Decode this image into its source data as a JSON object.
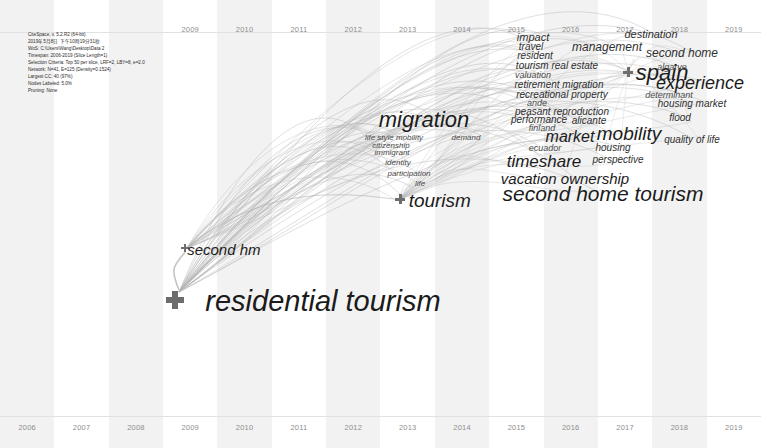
{
  "app": {
    "title": "CiteSpace Timezone View",
    "view_type": "timezone"
  },
  "info_panel": {
    "lines": [
      "CiteSpace, v. 5.2.R2 (64-bit)",
      "2019年5月8日 下午10時19分31秒",
      "WoS: C:\\Users\\Wang\\Desktop\\Data 2",
      "Timespan: 2006-2019 (Slice Length=1)",
      "Selection Criteria: Top 50 per slice, LRF=2, LBY=8, e=2.0",
      "Network: N=41, E=125 (Density=0.1524)",
      "Largest CC: 40 (97%)",
      "Nodes Labeled: 5.0%",
      "Pruning: None"
    ]
  },
  "axis": {
    "top_years": [
      "2009",
      "2010",
      "2011",
      "2012",
      "2013",
      "2014",
      "2015",
      "2016",
      "2017",
      "2018",
      "2019"
    ],
    "bottom_years": [
      "2006",
      "2007",
      "2008",
      "2009",
      "2010",
      "2011",
      "2012",
      "2013",
      "2014",
      "2015",
      "2016",
      "2017",
      "2018",
      "2019"
    ],
    "year_start": 2006,
    "year_end": 2019
  },
  "colors": {
    "band": "#f2f2f2",
    "edge": "#9a9a9a",
    "node": "#6d6d6d",
    "label": "#1b1b1b",
    "axis_text": "#8e8e8e"
  },
  "chart_data": {
    "type": "scatter",
    "xlabel": "",
    "ylabel": "",
    "xlim": [
      2006,
      2019
    ],
    "grid": false,
    "legend": "none",
    "terms": [
      {
        "label": "residential tourism",
        "x": 175,
        "y": 300,
        "size": 29,
        "weight": 1.0,
        "node": true,
        "node_size": 18
      },
      {
        "label": "second hm",
        "x": 185,
        "y": 248,
        "size": 15,
        "weight": 0.52,
        "node": true,
        "node_size": 8
      },
      {
        "label": "tourism",
        "x": 400,
        "y": 199,
        "size": 19,
        "weight": 0.66,
        "node": true,
        "node_size": 10
      },
      {
        "label": "migration",
        "x": 424,
        "y": 120,
        "size": 22,
        "weight": 0.76,
        "node": false,
        "node_size": 0
      },
      {
        "label": "life style mobility",
        "x": 394,
        "y": 138,
        "size": 8,
        "weight": 0.27,
        "node": false,
        "node_size": 0
      },
      {
        "label": "demand",
        "x": 466,
        "y": 138,
        "size": 8,
        "weight": 0.27,
        "node": false,
        "node_size": 0
      },
      {
        "label": "citizenship",
        "x": 391,
        "y": 146,
        "size": 8,
        "weight": 0.27,
        "node": false,
        "node_size": 0
      },
      {
        "label": "immigrant",
        "x": 392,
        "y": 153,
        "size": 8,
        "weight": 0.27,
        "node": false,
        "node_size": 0
      },
      {
        "label": "identity",
        "x": 398,
        "y": 163,
        "size": 8,
        "weight": 0.27,
        "node": false,
        "node_size": 0
      },
      {
        "label": "participation",
        "x": 409,
        "y": 174,
        "size": 8,
        "weight": 0.27,
        "node": false,
        "node_size": 0
      },
      {
        "label": "life",
        "x": 420,
        "y": 184,
        "size": 8,
        "weight": 0.27,
        "node": false,
        "node_size": 0
      },
      {
        "label": "impact",
        "x": 533,
        "y": 37,
        "size": 11,
        "weight": 0.38,
        "node": false,
        "node_size": 0
      },
      {
        "label": "destination",
        "x": 651,
        "y": 34,
        "size": 11,
        "weight": 0.38,
        "node": false,
        "node_size": 0
      },
      {
        "label": "travel",
        "x": 531,
        "y": 47,
        "size": 10,
        "weight": 0.34,
        "node": false,
        "node_size": 0
      },
      {
        "label": "management",
        "x": 607,
        "y": 47,
        "size": 12,
        "weight": 0.41,
        "node": false,
        "node_size": 0
      },
      {
        "label": "resident",
        "x": 535,
        "y": 56,
        "size": 10,
        "weight": 0.34,
        "node": false,
        "node_size": 0
      },
      {
        "label": "second home",
        "x": 682,
        "y": 53,
        "size": 12,
        "weight": 0.41,
        "node": false,
        "node_size": 0
      },
      {
        "label": "tourism real estate",
        "x": 557,
        "y": 66,
        "size": 10,
        "weight": 0.34,
        "node": false,
        "node_size": 0
      },
      {
        "label": "spain",
        "x": 628,
        "y": 72,
        "size": 22,
        "weight": 0.76,
        "node": true,
        "node_size": 10
      },
      {
        "label": "valuation",
        "x": 533,
        "y": 75,
        "size": 9,
        "weight": 0.31,
        "node": false,
        "node_size": 0
      },
      {
        "label": "algarve",
        "x": 672,
        "y": 67,
        "size": 9,
        "weight": 0.31,
        "node": false,
        "node_size": 0
      },
      {
        "label": "experience",
        "x": 700,
        "y": 83,
        "size": 18,
        "weight": 0.62,
        "node": false,
        "node_size": 0
      },
      {
        "label": "retirement migration",
        "x": 559,
        "y": 85,
        "size": 10,
        "weight": 0.34,
        "node": false,
        "node_size": 0
      },
      {
        "label": "recreational property",
        "x": 562,
        "y": 95,
        "size": 10,
        "weight": 0.34,
        "node": false,
        "node_size": 0
      },
      {
        "label": "determinant",
        "x": 669,
        "y": 95,
        "size": 9,
        "weight": 0.31,
        "node": false,
        "node_size": 0
      },
      {
        "label": "ande",
        "x": 537,
        "y": 103,
        "size": 9,
        "weight": 0.31,
        "node": false,
        "node_size": 0
      },
      {
        "label": "housing market",
        "x": 692,
        "y": 104,
        "size": 10,
        "weight": 0.34,
        "node": false,
        "node_size": 0
      },
      {
        "label": "peasant reproduction",
        "x": 562,
        "y": 112,
        "size": 10,
        "weight": 0.34,
        "node": false,
        "node_size": 0
      },
      {
        "label": "performance",
        "x": 539,
        "y": 120,
        "size": 10,
        "weight": 0.34,
        "node": false,
        "node_size": 0
      },
      {
        "label": "alicante",
        "x": 589,
        "y": 121,
        "size": 10,
        "weight": 0.34,
        "node": false,
        "node_size": 0
      },
      {
        "label": "flood",
        "x": 680,
        "y": 118,
        "size": 10,
        "weight": 0.34,
        "node": false,
        "node_size": 0
      },
      {
        "label": "finland",
        "x": 542,
        "y": 128,
        "size": 9,
        "weight": 0.31,
        "node": false,
        "node_size": 0
      },
      {
        "label": "market",
        "x": 570,
        "y": 137,
        "size": 16,
        "weight": 0.55,
        "node": false,
        "node_size": 0
      },
      {
        "label": "mobility",
        "x": 629,
        "y": 133,
        "size": 19,
        "weight": 0.66,
        "node": false,
        "node_size": 0
      },
      {
        "label": "quality of life",
        "x": 692,
        "y": 140,
        "size": 10,
        "weight": 0.34,
        "node": false,
        "node_size": 0
      },
      {
        "label": "ecuador",
        "x": 545,
        "y": 148,
        "size": 9,
        "weight": 0.31,
        "node": false,
        "node_size": 0
      },
      {
        "label": "housing",
        "x": 613,
        "y": 148,
        "size": 10,
        "weight": 0.34,
        "node": false,
        "node_size": 0
      },
      {
        "label": "timeshare",
        "x": 544,
        "y": 161,
        "size": 17,
        "weight": 0.59,
        "node": false,
        "node_size": 0
      },
      {
        "label": "perspective",
        "x": 618,
        "y": 160,
        "size": 10,
        "weight": 0.34,
        "node": false,
        "node_size": 0
      },
      {
        "label": "vacation ownership",
        "x": 565,
        "y": 178,
        "size": 15,
        "weight": 0.52,
        "node": false,
        "node_size": 0
      },
      {
        "label": "second home tourism",
        "x": 603,
        "y": 193,
        "size": 21,
        "weight": 0.72,
        "node": false,
        "node_size": 0
      }
    ]
  }
}
